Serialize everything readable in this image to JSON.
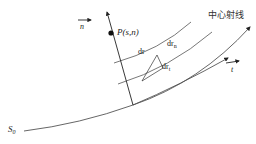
{
  "diagram": {
    "title": "",
    "labels": {
      "n_vector": "n",
      "point": "P(s,n)",
      "dr": "dr",
      "dr_n_base": "dr",
      "dr_n_sub": "n",
      "dr_t_base": "dr",
      "dr_t_sub": "t",
      "central_ray": "中心射线",
      "t_vector": "t",
      "origin_base": "S",
      "origin_sub": "0"
    },
    "colors": {
      "line": "#222222",
      "curve": "#555555",
      "background": "#ffffff"
    }
  }
}
